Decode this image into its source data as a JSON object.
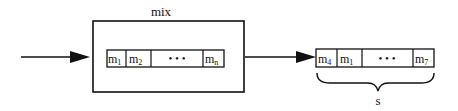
{
  "diagram": {
    "mix_label": "mix",
    "input_cells": [
      {
        "base": "m",
        "sub": "1"
      },
      {
        "base": "m",
        "sub": "2"
      },
      {
        "base": "• • •",
        "sub": ""
      },
      {
        "base": "m",
        "sub": "n"
      }
    ],
    "output_cells": [
      {
        "base": "m",
        "sub": "4"
      },
      {
        "base": "m",
        "sub": "1"
      },
      {
        "base": "• • •",
        "sub": ""
      },
      {
        "base": "m",
        "sub": "7"
      }
    ],
    "output_label": "s",
    "colors": {
      "stroke": "#111111",
      "background": "#ffffff"
    }
  }
}
